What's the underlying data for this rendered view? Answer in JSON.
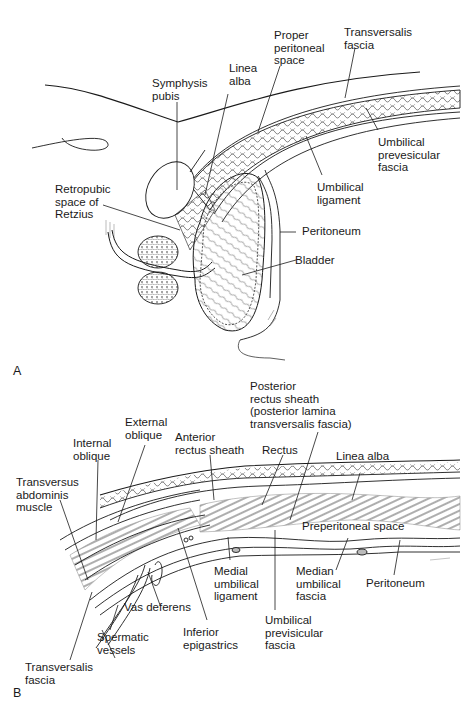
{
  "figure": {
    "panels": [
      {
        "id": "A",
        "letter": "A",
        "labels": {
          "transversalis_fascia": "Transversalis\nfascia",
          "proper_peritoneal_space": "Proper\nperitoneal\nspace",
          "linea_alba": "Linea\nalba",
          "symphysis_pubis": "Symphysis\npubis",
          "umbilical_prevesicular_fascia": "Umbilical\nprevesicular\nfascia",
          "umbilical_ligament": "Umbilical\nligament",
          "retropubic_space": "Retropubic\nspace of\nRetzius",
          "peritoneum": "Peritoneum",
          "bladder": "Bladder"
        }
      },
      {
        "id": "B",
        "letter": "B",
        "labels": {
          "posterior_rectus_sheath": "Posterior\nrectus sheath\n(posterior lamina\ntransversalis fascia)",
          "external_oblique": "External\noblique",
          "internal_oblique": "Internal\noblique",
          "anterior_rectus_sheath": "Anterior\nrectus sheath",
          "rectus": "Rectus",
          "linea_alba": "Linea alba",
          "transversus_abdominis": "Transversus\nabdominis\nmuscle",
          "preperitoneal_space": "Preperitoneal space",
          "medial_umbilical_ligament": "Medial\numbilical\nligament",
          "median_umbilical_fascia": "Median\numbilical\nfascia",
          "peritoneum": "Peritoneum",
          "vas_deferens": "Vas deferens",
          "inferior_epigastrics": "Inferior\nepigastrics",
          "umbilical_previsicular_fascia": "Umbilical\nprevisicular\nfascia",
          "spermatic_vessels": "Spermatic\nvessels",
          "transversalis_fascia": "Transversalis\nfascia"
        }
      }
    ],
    "colors": {
      "line": "#1a1a1a",
      "shade": "#9a9a9a",
      "background": "#ffffff"
    }
  }
}
